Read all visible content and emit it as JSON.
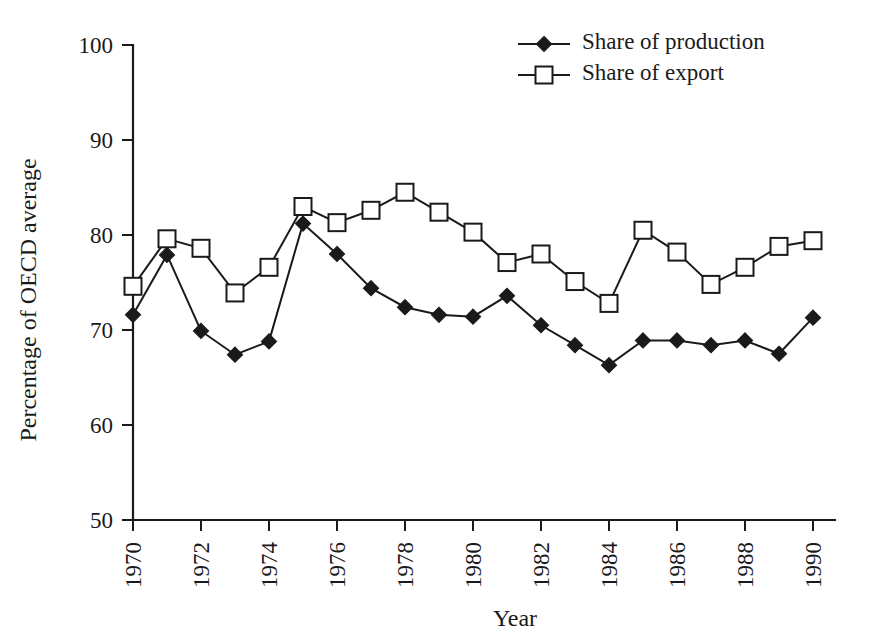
{
  "chart_data": {
    "type": "line",
    "title": "",
    "xlabel": "Year",
    "ylabel": "Percentage of OECD average",
    "xlim": [
      1970,
      1990
    ],
    "ylim": [
      50,
      100
    ],
    "yticks": [
      50,
      60,
      70,
      80,
      90,
      100
    ],
    "xticks": [
      1970,
      1972,
      1974,
      1976,
      1978,
      1980,
      1982,
      1984,
      1986,
      1988,
      1990
    ],
    "xtick_labels": [
      "1970",
      "1972",
      "1974",
      "1976",
      "1978",
      "1980",
      "1982",
      "1984",
      "1986",
      "1988",
      "1990"
    ],
    "ytick_labels": [
      "50",
      "60",
      "70",
      "80",
      "90",
      "100"
    ],
    "xtick_rotation": 90,
    "grid": false,
    "legend_position": "top-right",
    "x": [
      1970,
      1971,
      1972,
      1973,
      1974,
      1975,
      1976,
      1977,
      1978,
      1979,
      1980,
      1981,
      1982,
      1983,
      1984,
      1985,
      1986,
      1987,
      1988,
      1989,
      1990
    ],
    "series": [
      {
        "name": "Share of production",
        "marker": "filled-diamond",
        "values": [
          71.6,
          77.9,
          69.9,
          67.4,
          68.8,
          81.2,
          78.0,
          74.4,
          72.4,
          71.6,
          71.4,
          73.6,
          70.5,
          68.4,
          66.3,
          68.9,
          68.9,
          68.4,
          68.9,
          67.5,
          71.3
        ]
      },
      {
        "name": "Share of export",
        "marker": "open-square",
        "values": [
          74.6,
          79.6,
          78.6,
          73.9,
          76.6,
          83.0,
          81.3,
          82.6,
          84.5,
          82.4,
          80.3,
          77.1,
          78.0,
          75.1,
          72.8,
          80.5,
          78.2,
          74.8,
          76.6,
          78.8,
          79.4
        ]
      }
    ]
  },
  "legend": {
    "items": [
      {
        "label": "Share of production",
        "marker": "filled-diamond"
      },
      {
        "label": "Share of export",
        "marker": "open-square"
      }
    ]
  },
  "axes": {
    "x_title": "Year",
    "y_title": "Percentage of OECD average"
  },
  "colors": {
    "ink": "#1a1a1a",
    "background": "#ffffff",
    "marker_fill": "#ffffff"
  }
}
